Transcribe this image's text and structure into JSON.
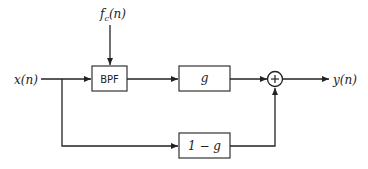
{
  "diagram": {
    "type": "signal-flow block diagram",
    "input_label": "x(n)",
    "control_label_main": "f",
    "control_label_sub": "c",
    "control_label_tail": "(n)",
    "output_label": "y(n)",
    "blocks": [
      {
        "id": "bpf",
        "label": "BPF"
      },
      {
        "id": "gain",
        "label": "g"
      },
      {
        "id": "complement_gain",
        "label": "1 − g"
      }
    ],
    "summer": {
      "symbol": "+"
    },
    "colors": {
      "stroke": "#222222",
      "background": "#ffffff"
    }
  }
}
